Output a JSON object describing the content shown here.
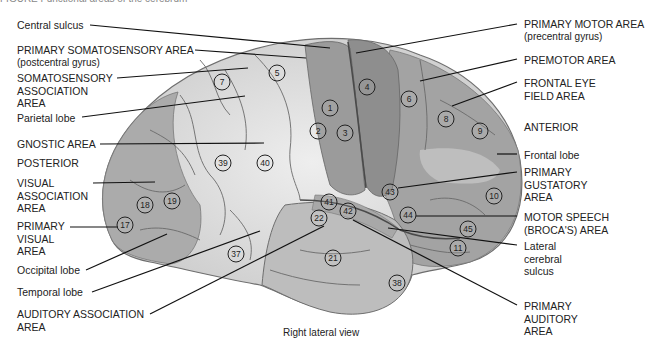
{
  "figure": {
    "caption_cut": "FIGURE  Functional areas of the cerebrum",
    "view_label": "Right lateral view"
  },
  "labels": {
    "central_sulcus": "Central sulcus",
    "primary_somatosensory": "PRIMARY SOMATOSENSORY AREA",
    "primary_somatosensory_sub": "(postcentral gyrus)",
    "somatosensory_association": "SOMATOSENSORY\nASSOCIATION\nAREA",
    "parietal_lobe": "Parietal lobe",
    "gnostic_area": "GNOSTIC AREA",
    "posterior": "POSTERIOR",
    "visual_association": "VISUAL\nASSOCIATION\nAREA",
    "primary_visual": "PRIMARY\nVISUAL\nAREA",
    "occipital_lobe": "Occipital lobe",
    "temporal_lobe": "Temporal lobe",
    "auditory_association": "AUDITORY ASSOCIATION\nAREA",
    "primary_motor": "PRIMARY MOTOR AREA",
    "primary_motor_sub": "(precentral gyrus)",
    "premotor": "PREMOTOR AREA",
    "frontal_eye_field": "FRONTAL EYE\nFIELD AREA",
    "anterior": "ANTERIOR",
    "frontal_lobe": "Frontal lobe",
    "primary_gustatory": "PRIMARY\nGUSTATORY\nAREA",
    "motor_speech": "MOTOR SPEECH\n(BROCA'S) AREA",
    "lateral_cerebral_sulcus": "Lateral\ncerebral\nsulcus",
    "primary_auditory": "PRIMARY\nAUDITORY\nAREA"
  },
  "brodmann_areas": [
    {
      "n": "1",
      "x": 330,
      "y": 108
    },
    {
      "n": "2",
      "x": 318,
      "y": 131
    },
    {
      "n": "3",
      "x": 345,
      "y": 133
    },
    {
      "n": "4",
      "x": 367,
      "y": 87
    },
    {
      "n": "5",
      "x": 277,
      "y": 73
    },
    {
      "n": "6",
      "x": 409,
      "y": 99
    },
    {
      "n": "7",
      "x": 222,
      "y": 82
    },
    {
      "n": "8",
      "x": 446,
      "y": 119
    },
    {
      "n": "9",
      "x": 480,
      "y": 131
    },
    {
      "n": "10",
      "x": 494,
      "y": 196
    },
    {
      "n": "11",
      "x": 458,
      "y": 248
    },
    {
      "n": "17",
      "x": 125,
      "y": 225
    },
    {
      "n": "18",
      "x": 145,
      "y": 205
    },
    {
      "n": "19",
      "x": 172,
      "y": 201
    },
    {
      "n": "21",
      "x": 333,
      "y": 258
    },
    {
      "n": "22",
      "x": 319,
      "y": 218
    },
    {
      "n": "37",
      "x": 236,
      "y": 254
    },
    {
      "n": "38",
      "x": 397,
      "y": 283
    },
    {
      "n": "39",
      "x": 223,
      "y": 163
    },
    {
      "n": "40",
      "x": 265,
      "y": 163
    },
    {
      "n": "41",
      "x": 329,
      "y": 202
    },
    {
      "n": "42",
      "x": 348,
      "y": 211
    },
    {
      "n": "43",
      "x": 390,
      "y": 192
    },
    {
      "n": "44",
      "x": 408,
      "y": 215
    },
    {
      "n": "45",
      "x": 468,
      "y": 229
    }
  ],
  "colors": {
    "parietal_temporal_fill": "#d8d8d8",
    "occipital_fill": "#a9a9a9",
    "frontal_fill": "#9a9a9a",
    "motor_strip": "#8c8c8c",
    "sulcus_line": "#5a5a5a",
    "leader_line": "#111111"
  }
}
